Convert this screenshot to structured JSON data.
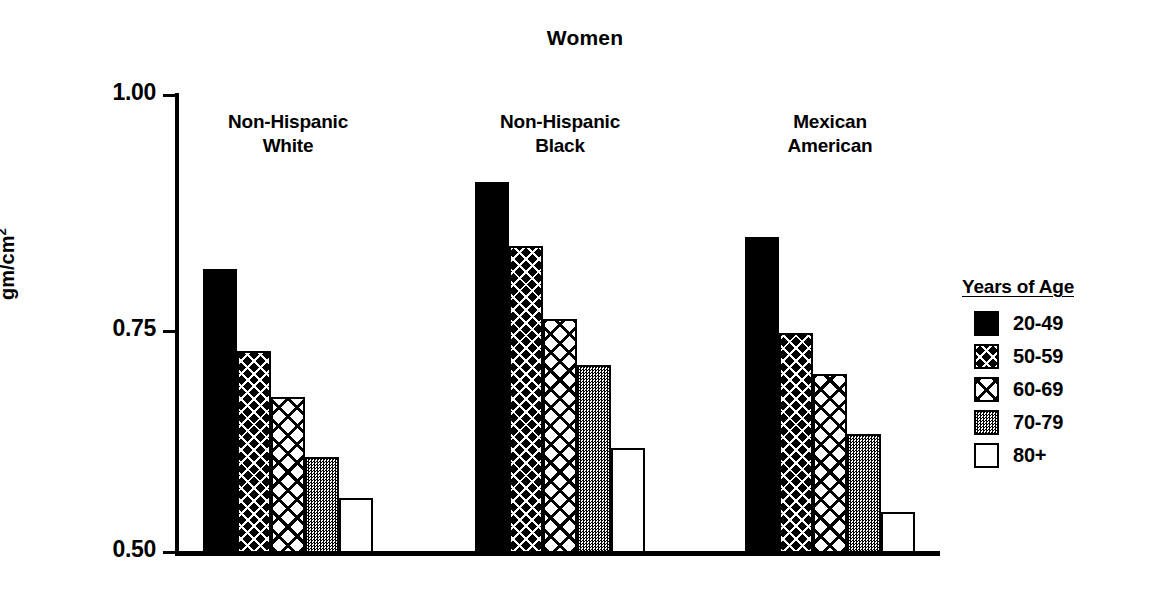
{
  "chart_data": {
    "type": "bar",
    "title": "Women",
    "xlabel": "",
    "ylabel": "gm/cm2",
    "ylabel_display": "gm/cm",
    "ylabel_sup": "2",
    "ylim": [
      0.5,
      1.0
    ],
    "yticks": [
      "0.50",
      "0.75",
      "1.00"
    ],
    "grid": false,
    "legend_position": "right",
    "legend_title": "Years of Age",
    "categories": [
      "Non-Hispanic White",
      "Non-Hispanic Black",
      "Mexican American"
    ],
    "category_lines": [
      [
        "Non-Hispanic",
        "White"
      ],
      [
        "Non-Hispanic",
        "Black"
      ],
      [
        "Mexican",
        "American"
      ]
    ],
    "series": [
      {
        "name": "20-49",
        "pattern": "solid-black",
        "values": [
          0.81,
          0.905,
          0.845
        ]
      },
      {
        "name": "50-59",
        "pattern": "dense-hatch",
        "values": [
          0.72,
          0.835,
          0.74
        ]
      },
      {
        "name": "60-69",
        "pattern": "open-hatch",
        "values": [
          0.67,
          0.755,
          0.695
        ]
      },
      {
        "name": "70-79",
        "pattern": "gray-dither",
        "values": [
          0.605,
          0.705,
          0.63
        ]
      },
      {
        "name": "80+",
        "pattern": "white-outline",
        "values": [
          0.56,
          0.615,
          0.545
        ]
      }
    ]
  },
  "colors": {
    "ink": "#000000",
    "background": "#ffffff",
    "gray_fill": "#808080"
  }
}
